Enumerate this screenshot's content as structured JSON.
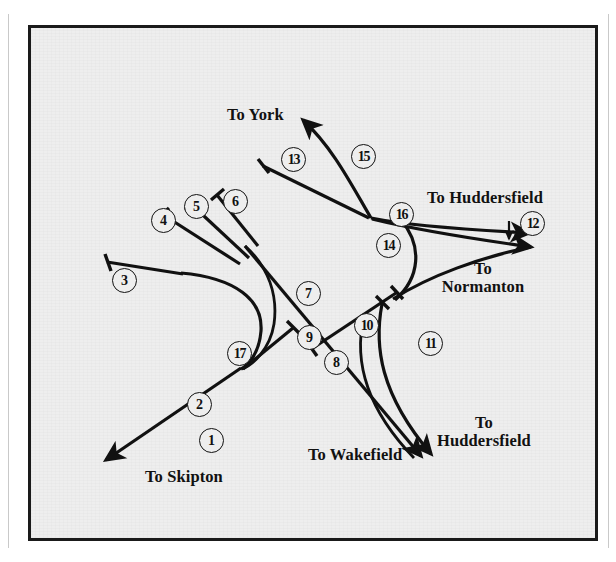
{
  "figure": {
    "kind": "railway-junction-schematic",
    "background_color": "#eeeeee",
    "ink_color": "#111111",
    "frame_color": "#1a1a1a"
  },
  "destinations": [
    {
      "id": "york",
      "label": "To York",
      "x": 196,
      "y": 78,
      "align": "left"
    },
    {
      "id": "huddersfield-ne",
      "label": "To Huddersfield",
      "x": 396,
      "y": 161,
      "align": "left"
    },
    {
      "id": "normanton",
      "label": "To\nNormanton",
      "x": 452,
      "y": 232,
      "align": "center"
    },
    {
      "id": "huddersfield-se",
      "label": "To\nHuddersfield",
      "x": 453,
      "y": 386,
      "align": "center"
    },
    {
      "id": "wakefield",
      "label": "To Wakefield",
      "x": 277,
      "y": 418,
      "align": "left"
    },
    {
      "id": "skipton",
      "label": "To Skipton",
      "x": 114,
      "y": 440,
      "align": "left"
    }
  ],
  "route_numbers": [
    {
      "id": 1,
      "label": "1",
      "x": 168,
      "y": 400
    },
    {
      "id": 2,
      "label": "2",
      "x": 156,
      "y": 364
    },
    {
      "id": 3,
      "label": "3",
      "x": 81,
      "y": 240
    },
    {
      "id": 4,
      "label": "4",
      "x": 120,
      "y": 180
    },
    {
      "id": 5,
      "label": "5",
      "x": 153,
      "y": 166
    },
    {
      "id": 6,
      "label": "6",
      "x": 192,
      "y": 161
    },
    {
      "id": 7,
      "label": "7",
      "x": 265,
      "y": 253
    },
    {
      "id": 8,
      "label": "8",
      "x": 293,
      "y": 322
    },
    {
      "id": 9,
      "label": "9",
      "x": 266,
      "y": 297
    },
    {
      "id": 10,
      "label": "10",
      "x": 323,
      "y": 285
    },
    {
      "id": 11,
      "label": "11",
      "x": 387,
      "y": 303
    },
    {
      "id": 12,
      "label": "12",
      "x": 489,
      "y": 183
    },
    {
      "id": 13,
      "label": "13",
      "x": 250,
      "y": 119
    },
    {
      "id": 14,
      "label": "14",
      "x": 345,
      "y": 205
    },
    {
      "id": 15,
      "label": "15",
      "x": 320,
      "y": 116
    },
    {
      "id": 16,
      "label": "16",
      "x": 358,
      "y": 174
    },
    {
      "id": 17,
      "label": "17",
      "x": 196,
      "y": 313
    }
  ]
}
